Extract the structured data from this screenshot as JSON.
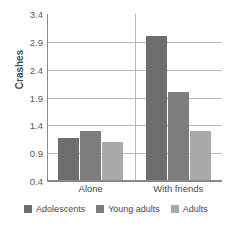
{
  "chart_data": {
    "type": "bar",
    "title": "",
    "xlabel": "",
    "ylabel": "Crashes",
    "categories": [
      "Alone",
      "With friends"
    ],
    "series": [
      {
        "name": "Adolescents",
        "color": "#6e6e6e",
        "values": [
          1.18,
          3.0
        ]
      },
      {
        "name": "Young adults",
        "color": "#7d7d7d",
        "values": [
          1.3,
          2.0
        ]
      },
      {
        "name": "Adults",
        "color": "#a9a9a9",
        "values": [
          1.1,
          1.3
        ]
      }
    ],
    "ylim": [
      0.4,
      3.4
    ],
    "yticks": [
      "0.4",
      "0.9",
      "1.4",
      "1.9",
      "2.4",
      "2.9",
      "3.4"
    ],
    "ytick_values": [
      0.4,
      0.9,
      1.4,
      1.9,
      2.4,
      2.9,
      3.4
    ],
    "grid": "horizontal",
    "legend_position": "bottom"
  },
  "axis": {
    "y_title": "Crashes",
    "tick_0": "0.4",
    "tick_1": "0.9",
    "tick_2": "1.4",
    "tick_3": "1.9",
    "tick_4": "2.4",
    "tick_5": "2.9",
    "tick_6": "3.4"
  },
  "categories": {
    "cat_0": "Alone",
    "cat_1": "With friends"
  },
  "legend": {
    "item_0": "Adolescents",
    "item_1": "Young adults",
    "item_2": "Adults"
  },
  "colors": {
    "adolescents": "#6e6e6e",
    "young_adults": "#7d7d7d",
    "adults": "#a9a9a9",
    "gridline": "#b9b9b9",
    "axis": "#8a8a8a",
    "text": "#4a4a4a",
    "background": "#ffffff"
  }
}
